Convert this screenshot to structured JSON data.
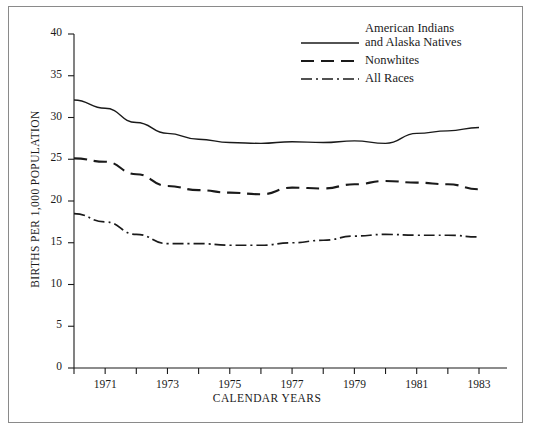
{
  "figure": {
    "background_color": "#ffffff",
    "line_color": "#1a1a1a",
    "frame_color": "#8a8a8a"
  },
  "legend": {
    "position": "top-right",
    "items": [
      {
        "label_line1": "American Indians",
        "label_line2": "and Alaska Natives",
        "style": "solid",
        "name": "american-indians-and-alaska-natives"
      },
      {
        "label_line1": "Nonwhites",
        "label_line2": "",
        "style": "dashed",
        "name": "nonwhites"
      },
      {
        "label_line1": "All Races",
        "label_line2": "",
        "style": "dash-dot",
        "name": "all-races"
      }
    ]
  },
  "chart_data": {
    "type": "line",
    "title": "",
    "xlabel": "CALENDAR YEARS",
    "ylabel": "BIRTHS PER 1,000 POPULATION",
    "xlim": [
      1970,
      1983
    ],
    "ylim": [
      0,
      40
    ],
    "grid": false,
    "x": [
      1970,
      1971,
      1972,
      1973,
      1974,
      1975,
      1976,
      1977,
      1978,
      1979,
      1980,
      1981,
      1982,
      1983
    ],
    "xticks": [
      1971,
      1973,
      1975,
      1977,
      1979,
      1981,
      1983
    ],
    "xticklabels": [
      "1971",
      "1973",
      "1975",
      "1977",
      "1979",
      "1981",
      "1983"
    ],
    "xminorticks": [
      1970,
      1972,
      1974,
      1976,
      1978,
      1980,
      1982
    ],
    "yticks": [
      0,
      5,
      10,
      15,
      20,
      25,
      30,
      35,
      40
    ],
    "yticklabels": [
      "0",
      "5",
      "10",
      "15",
      "20",
      "25",
      "30",
      "35",
      "40"
    ],
    "series": [
      {
        "name": "American Indians and Alaska Natives",
        "style": "solid",
        "values": [
          32.1,
          31.1,
          29.4,
          28.1,
          27.4,
          27.0,
          26.9,
          27.1,
          27.0,
          27.2,
          26.9,
          28.1,
          28.4,
          28.8
        ]
      },
      {
        "name": "Nonwhites",
        "style": "dashed",
        "values": [
          25.1,
          24.7,
          23.2,
          21.8,
          21.3,
          21.0,
          20.8,
          21.6,
          21.5,
          22.0,
          22.4,
          22.2,
          22.0,
          21.4
        ]
      },
      {
        "name": "All Races",
        "style": "dash-dot",
        "values": [
          18.5,
          17.5,
          16.0,
          14.9,
          14.9,
          14.7,
          14.7,
          15.0,
          15.3,
          15.8,
          16.0,
          15.9,
          15.9,
          15.7
        ]
      }
    ]
  }
}
